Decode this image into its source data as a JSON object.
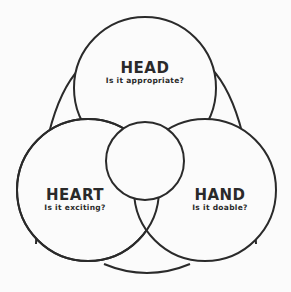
{
  "diagram": {
    "stroke_color": "#2a2a2a",
    "background": "#fbfbfb",
    "sections": [
      {
        "id": "head",
        "title": "HEAD",
        "question": "Is it appropriate?"
      },
      {
        "id": "heart",
        "title": "HEART",
        "question": "Is it exciting?"
      },
      {
        "id": "hand",
        "title": "HAND",
        "question": "Is it doable?"
      }
    ],
    "center": {
      "title": "",
      "question": ""
    }
  }
}
